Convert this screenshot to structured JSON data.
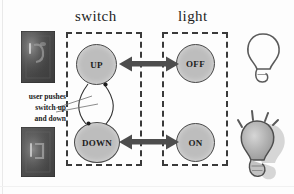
{
  "diagram": {
    "title_columns": {
      "switch": "switch",
      "light": "light"
    },
    "states": {
      "up": "UP",
      "down": "DOWN",
      "off": "OFF",
      "on": "ON"
    },
    "annotation": {
      "line1": "user pushes",
      "line2": "switch up",
      "line3": "and down"
    },
    "photos": {
      "top_caption": "photo-switch-up",
      "bottom_caption": "photo-switch-down"
    },
    "bulbs": {
      "unlit": "bulb-off-outline",
      "lit": "bulb-on-glowing"
    },
    "colors": {
      "node_fill": "#bdbdbd",
      "node_stroke": "#4a4a4a",
      "dashed_box": "#3a3a3a",
      "arrow": "#4d4d4d",
      "text": "#1b1b1b",
      "background": "#fdfdfd"
    },
    "edges": {
      "up_off": "bidirectional",
      "down_on": "bidirectional",
      "up_down": "bidirectional-curved"
    }
  }
}
